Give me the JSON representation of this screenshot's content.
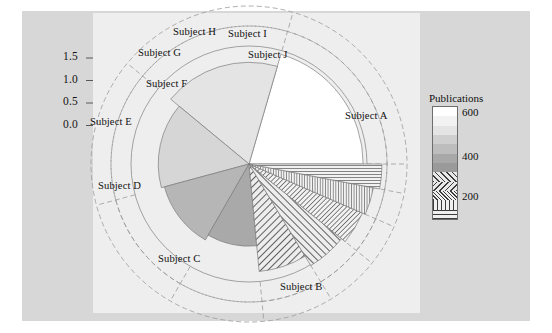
{
  "figure": {
    "width": 552,
    "height": 333,
    "background": "#ffffff",
    "outer_panel_color": "#d7d7d7",
    "inner_panel_color": "#eeeeee"
  },
  "legend": {
    "title": "Publications",
    "ticks": [
      {
        "label": "600",
        "value": 600
      },
      {
        "label": "400",
        "value": 400
      },
      {
        "label": "200",
        "value": 200
      }
    ],
    "bands": [
      {
        "value": 650,
        "fill": "#ffffff",
        "pattern": "solid"
      },
      {
        "value": 600,
        "fill": "#f2f2f2",
        "pattern": "solid"
      },
      {
        "value": 550,
        "fill": "#e4e4e4",
        "pattern": "solid"
      },
      {
        "value": 500,
        "fill": "#cfcfcf",
        "pattern": "solid"
      },
      {
        "value": 450,
        "fill": "#bdbdbd",
        "pattern": "solid"
      },
      {
        "value": 400,
        "fill": "#a8a8a8",
        "pattern": "solid"
      },
      {
        "value": 350,
        "fill": "#9a9a9a",
        "pattern": "solid"
      },
      {
        "value": 300,
        "fill": "#e8e8e8",
        "pattern": "diag-left"
      },
      {
        "value": 250,
        "fill": "#e8e8e8",
        "pattern": "diag-right"
      },
      {
        "value": 200,
        "fill": "#f0f0f0",
        "pattern": "diag-left-fine"
      },
      {
        "value": 150,
        "fill": "#f0f0f0",
        "pattern": "vertical"
      },
      {
        "value": 100,
        "fill": "#f0f0f0",
        "pattern": "horizontal"
      }
    ]
  },
  "chart_data": {
    "type": "pie",
    "title": "",
    "xlabel": "",
    "ylabel": "",
    "yaxis": {
      "ticks": [
        "1.5",
        "1.0",
        "0.5",
        "0.0"
      ],
      "values": [
        1.5,
        1.0,
        0.5,
        0.0
      ],
      "ylim": [
        0.0,
        1.75
      ]
    },
    "grid": true,
    "legend_position": "right",
    "center": {
      "x": 249,
      "y": 164
    },
    "inner_pie_max_radius": 118,
    "guide_rings": [
      118,
      138,
      158
    ],
    "categories": [
      "Subject A",
      "Subject B",
      "Subject C",
      "Subject D",
      "Subject E",
      "Subject F",
      "Subject G",
      "Subject H",
      "Subject I",
      "Subject J"
    ],
    "series": [
      {
        "name": "angle_fraction",
        "values": [
          0.205,
          0.185,
          0.152,
          0.125,
          0.098,
          0.072,
          0.055,
          0.043,
          0.035,
          0.03
        ]
      },
      {
        "name": "radius_value",
        "values": [
          1.46,
          1.3,
          1.16,
          1.12,
          1.05,
          1.38,
          1.52,
          1.58,
          1.62,
          1.7
        ]
      },
      {
        "name": "publications",
        "values": [
          640,
          560,
          520,
          470,
          430,
          300,
          260,
          215,
          160,
          120
        ]
      }
    ],
    "slices": [
      {
        "label": "Subject A",
        "angle_fraction": 0.205,
        "radius_value": 1.46,
        "publications": 640,
        "fill": "#ffffff",
        "pattern": "solid",
        "label_pos": {
          "x": 345,
          "y": 110
        }
      },
      {
        "label": "Subject B",
        "angle_fraction": 0.185,
        "radius_value": 1.3,
        "publications": 560,
        "fill": "#e4e4e4",
        "pattern": "solid",
        "label_pos": {
          "x": 280,
          "y": 281
        }
      },
      {
        "label": "Subject C",
        "angle_fraction": 0.152,
        "radius_value": 1.16,
        "publications": 520,
        "fill": "#d6d6d6",
        "pattern": "solid",
        "label_pos": {
          "x": 158,
          "y": 253
        }
      },
      {
        "label": "Subject D",
        "angle_fraction": 0.125,
        "radius_value": 1.12,
        "publications": 470,
        "fill": "#b6b6b6",
        "pattern": "solid",
        "label_pos": {
          "x": 98,
          "y": 180
        }
      },
      {
        "label": "Subject E",
        "angle_fraction": 0.098,
        "radius_value": 1.05,
        "publications": 430,
        "fill": "#a9a9a9",
        "pattern": "solid",
        "label_pos": {
          "x": 90,
          "y": 116
        }
      },
      {
        "label": "Subject F",
        "angle_fraction": 0.072,
        "radius_value": 1.38,
        "publications": 300,
        "fill": "#e8e8e8",
        "pattern": "diag-left",
        "label_pos": {
          "x": 146,
          "y": 78
        }
      },
      {
        "label": "Subject G",
        "angle_fraction": 0.055,
        "radius_value": 1.52,
        "publications": 260,
        "fill": "#e8e8e8",
        "pattern": "diag-right",
        "label_pos": {
          "x": 138,
          "y": 47
        }
      },
      {
        "label": "Subject H",
        "angle_fraction": 0.043,
        "radius_value": 1.58,
        "publications": 215,
        "fill": "#f0f0f0",
        "pattern": "diag-left-fine",
        "label_pos": {
          "x": 173,
          "y": 26
        }
      },
      {
        "label": "Subject I",
        "angle_fraction": 0.035,
        "radius_value": 1.62,
        "publications": 160,
        "fill": "#f0f0f0",
        "pattern": "vertical-fine",
        "label_pos": {
          "x": 228,
          "y": 28
        }
      },
      {
        "label": "Subject J",
        "angle_fraction": 0.03,
        "radius_value": 1.7,
        "publications": 120,
        "fill": "#f0f0f0",
        "pattern": "horizontal",
        "label_pos": {
          "x": 248,
          "y": 49
        }
      }
    ]
  }
}
